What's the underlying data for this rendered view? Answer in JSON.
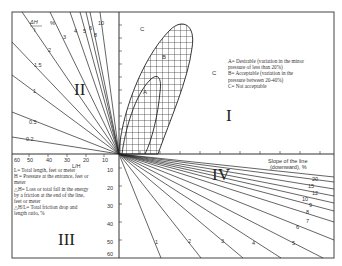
{
  "quadrants": {
    "q1": "I",
    "q2": "II",
    "q3": "III",
    "q4": "IV"
  },
  "regions": {
    "a": "A",
    "b": "B",
    "c1": "C",
    "c2": "C"
  },
  "legend_right": [
    "A= Desirable (variation in the minor",
    "pressure of less than 20%)",
    "B= Acceptable (variation in the",
    "pressure between 20-40%)",
    "C= Not acceptable"
  ],
  "legend_left": [
    "L= Total length, feet or meter",
    "H = Pressure at the entrance, feet or",
    "meter",
    "△H= Loss or total fall in the energy",
    "by a friction at the end of the line,",
    "feet or meter",
    "△H/L= Total friction drop and",
    "length ratio, %"
  ],
  "axes": {
    "top_left_label_num": "ΔH",
    "top_left_label_den": "l",
    "top_left_unit": "%",
    "l_over_h_label": "L/H",
    "l_over_h_ticks": [
      "60",
      "50",
      "40",
      "30",
      "20",
      "10"
    ],
    "slope_label_1": "Slope of the line",
    "slope_label_2": "(downward), %",
    "vertical_ticks": [
      "10",
      "20",
      "30",
      "40",
      "50",
      "60"
    ]
  },
  "q2_lines": [
    "0.2",
    "0.5",
    "1",
    "1.5",
    "2",
    "3",
    "4",
    "5",
    "6",
    "8",
    "10"
  ],
  "q4_lines": [
    "1",
    "2",
    "3",
    "4",
    "5",
    "6",
    "7",
    "8",
    "9",
    "10",
    "12",
    "15",
    "20"
  ]
}
